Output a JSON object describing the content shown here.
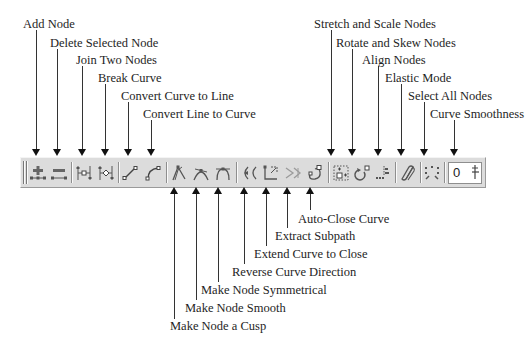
{
  "diagram": {
    "top_labels": [
      {
        "id": "add-node",
        "label": "Add Node"
      },
      {
        "id": "delete-selected-node",
        "label": "Delete Selected Node"
      },
      {
        "id": "join-two-nodes",
        "label": "Join Two Nodes"
      },
      {
        "id": "break-curve",
        "label": "Break Curve"
      },
      {
        "id": "convert-curve-to-line",
        "label": "Convert Curve to Line"
      },
      {
        "id": "convert-line-to-curve",
        "label": "Convert Line to Curve"
      },
      {
        "id": "stretch-and-scale-nodes",
        "label": "Stretch and Scale Nodes"
      },
      {
        "id": "rotate-and-skew-nodes",
        "label": "Rotate and Skew Nodes"
      },
      {
        "id": "align-nodes",
        "label": "Align Nodes"
      },
      {
        "id": "elastic-mode",
        "label": "Elastic Mode"
      },
      {
        "id": "select-all-nodes",
        "label": "Select All Nodes"
      },
      {
        "id": "curve-smoothness",
        "label": "Curve Smoothness"
      }
    ],
    "bottom_labels": [
      {
        "id": "auto-close-curve",
        "label": "Auto-Close Curve"
      },
      {
        "id": "extract-subpath",
        "label": "Extract Subpath"
      },
      {
        "id": "extend-curve-to-close",
        "label": "Extend Curve to Close"
      },
      {
        "id": "reverse-curve-direction",
        "label": "Reverse Curve Direction"
      },
      {
        "id": "make-node-symmetrical",
        "label": "Make Node Symmetrical"
      },
      {
        "id": "make-node-smooth",
        "label": "Make Node Smooth"
      },
      {
        "id": "make-node-a-cusp",
        "label": "Make Node a Cusp"
      }
    ]
  },
  "toolbar": {
    "buttons": [
      {
        "name": "add-node",
        "icon": "add-node-icon"
      },
      {
        "name": "delete-node",
        "icon": "delete-node-icon"
      },
      {
        "name": "join-nodes",
        "icon": "join-nodes-icon"
      },
      {
        "name": "break-curve",
        "icon": "break-curve-icon"
      },
      {
        "name": "to-line",
        "icon": "curve-to-line-icon"
      },
      {
        "name": "to-curve",
        "icon": "line-to-curve-icon"
      },
      {
        "name": "cusp",
        "icon": "cusp-node-icon"
      },
      {
        "name": "smooth",
        "icon": "smooth-node-icon"
      },
      {
        "name": "symmetrical",
        "icon": "symmetrical-node-icon"
      },
      {
        "name": "reverse",
        "icon": "reverse-direction-icon"
      },
      {
        "name": "extend-close",
        "icon": "extend-close-icon"
      },
      {
        "name": "extract-subpath",
        "icon": "extract-subpath-icon"
      },
      {
        "name": "auto-close",
        "icon": "auto-close-icon"
      },
      {
        "name": "stretch-scale",
        "icon": "stretch-scale-icon"
      },
      {
        "name": "rotate-skew",
        "icon": "rotate-skew-icon"
      },
      {
        "name": "align",
        "icon": "align-nodes-icon"
      },
      {
        "name": "elastic",
        "icon": "elastic-mode-icon"
      },
      {
        "name": "select-all",
        "icon": "select-all-nodes-icon"
      }
    ],
    "curve_smoothness": {
      "value": "0"
    }
  }
}
